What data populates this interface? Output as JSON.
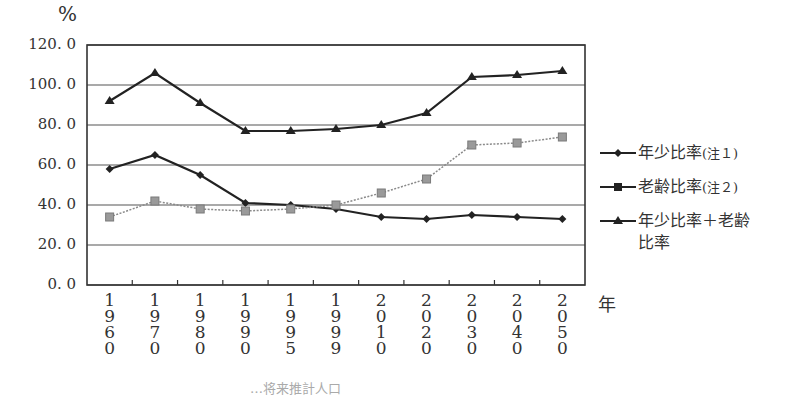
{
  "chart_data": {
    "type": "line",
    "title": "",
    "ylabel": "%",
    "xlabel": "年",
    "ylim": [
      0,
      120
    ],
    "yticks": [
      "0. 0",
      "20. 0",
      "40. 0",
      "60. 0",
      "80. 0",
      "100. 0",
      "120. 0"
    ],
    "grid": true,
    "legend_position": "right",
    "categories": [
      "1960",
      "1970",
      "1980",
      "1990",
      "1995",
      "1999",
      "2010",
      "2020",
      "2030",
      "2040",
      "2050"
    ],
    "series": [
      {
        "name": "年少比率(注1)",
        "marker": "diamond",
        "line": "solid",
        "color": "#222222",
        "values": [
          58,
          65,
          55,
          41,
          40,
          38,
          34,
          33,
          35,
          34,
          33
        ]
      },
      {
        "name": "老齢比率(注2)",
        "marker": "square",
        "line": "dotted",
        "color": "#8a8a8a",
        "values": [
          34,
          42,
          38,
          37,
          38,
          40,
          46,
          53,
          70,
          71,
          74
        ]
      },
      {
        "name": "年少比率+老齢比率",
        "marker": "triangle",
        "line": "solid",
        "color": "#222222",
        "values": [
          92,
          106,
          91,
          77,
          77,
          78,
          80,
          86,
          104,
          105,
          107
        ]
      }
    ]
  },
  "labels": {
    "y_unit": "%",
    "x_unit": "年",
    "footer_partial": "…将来推計人口"
  },
  "legend": [
    {
      "label": "年少比率",
      "note": "(注１)"
    },
    {
      "label": "老齢比率",
      "note": "(注２)"
    },
    {
      "label": "年少比率＋老齢",
      "label2": "比率"
    }
  ]
}
